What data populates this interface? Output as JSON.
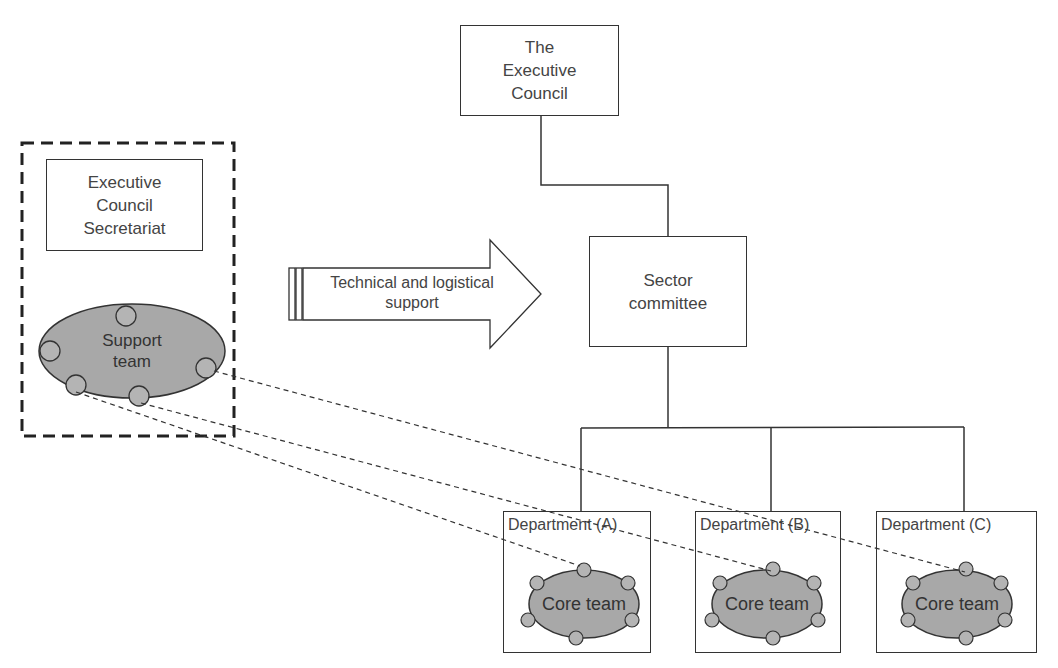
{
  "diagram": {
    "nodes": {
      "executive_council": {
        "label": "The\nExecutive\nCouncil"
      },
      "secretariat": {
        "label": "Executive\nCouncil\nSecretariat"
      },
      "sector_committee": {
        "label": "Sector\ncommittee"
      },
      "support_team": {
        "label": "Support\nteam"
      },
      "departments": [
        {
          "label": "Department (A)",
          "team_label": "Core team"
        },
        {
          "label": "Department (B)",
          "team_label": "Core team"
        },
        {
          "label": "Department (C)",
          "team_label": "Core team"
        }
      ]
    },
    "arrow": {
      "label": "Technical and logistical\nsupport"
    },
    "colors": {
      "line": "#333333",
      "team_fill": "#a8a8a8",
      "member_fill": "#b4b4b4"
    }
  }
}
